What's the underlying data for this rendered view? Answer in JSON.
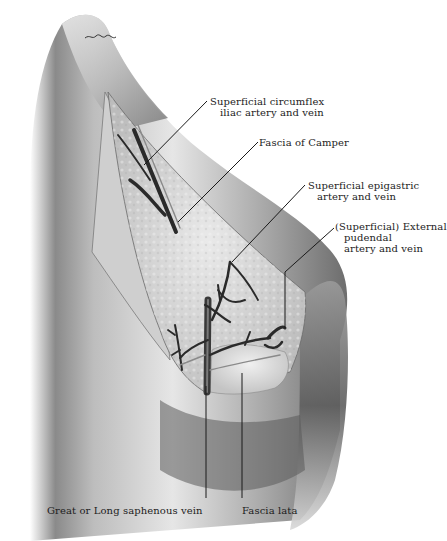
{
  "figure": {
    "type": "anatomical illustration",
    "signature": "illegible artist signature"
  },
  "labels": {
    "circumflex": {
      "line1": "Superficial circumflex",
      "line2": "iliac artery and vein"
    },
    "camper": {
      "line1": "Fascia of Camper"
    },
    "epigastric": {
      "line1": "Superficial epigastric",
      "line2": "artery and vein"
    },
    "pudendal": {
      "line1": "(Superficial) External",
      "line2": "pudendal",
      "line3": "artery and vein"
    },
    "saphenous": {
      "line1": "Great or Long saphenous vein"
    },
    "fascia_lata": {
      "line1": "Fascia lata"
    }
  },
  "colors": {
    "background": "#ffffff",
    "skin_dark": "#6a6a6a",
    "skin_mid": "#a8a8a8",
    "skin_light": "#dcdcdc",
    "vessel": "#2a2a2a",
    "fat": "#d6d6d6",
    "leader": "#1a1a1a",
    "text": "#1c1c1c"
  }
}
